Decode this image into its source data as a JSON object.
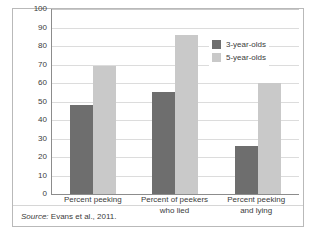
{
  "chart_data": {
    "type": "bar",
    "title": "",
    "subtitle": "",
    "xlabel": "",
    "ylabel": "",
    "ylim": [
      0,
      100
    ],
    "yticks": [
      "0",
      "10",
      "20",
      "30",
      "40",
      "50",
      "60",
      "70",
      "80",
      "90",
      "100"
    ],
    "grid": true,
    "legend_position": "top-right",
    "categories": [
      "Percent peeking",
      "Percent of peekers who lied",
      "Percent peeking and lying"
    ],
    "category_lines": [
      [
        "Percent peeking"
      ],
      [
        "Percent of peekers",
        "who lied"
      ],
      [
        "Percent peeking",
        "and lying"
      ]
    ],
    "series": [
      {
        "name": "3-year-olds",
        "color": "#6e6e6e",
        "values": [
          48,
          55,
          26
        ]
      },
      {
        "name": "5-year-olds",
        "color": "#c9c9c9",
        "values": [
          69,
          86,
          60
        ]
      }
    ]
  },
  "source_note": {
    "label": "Source:",
    "text": "Evans et al., 2011."
  }
}
